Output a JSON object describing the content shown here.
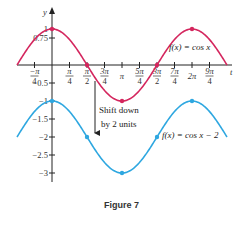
{
  "chart_data": {
    "type": "line",
    "title": "",
    "caption": "Figure 7",
    "xlabel": "t",
    "ylabel": "y",
    "xlim": [
      -1.5708,
      7.854
    ],
    "ylim": [
      -3.2,
      1.2
    ],
    "grid": false,
    "x_ticks": [
      {
        "num": "−π",
        "den": "4",
        "value": -0.7854
      },
      {
        "num": "π",
        "den": "4",
        "value": 0.7854
      },
      {
        "num": "π",
        "den": "2",
        "value": 1.5708
      },
      {
        "num": "3π",
        "den": "4",
        "value": 2.3562
      },
      {
        "num": "π",
        "den": "",
        "value": 3.1416
      },
      {
        "num": "5π",
        "den": "4",
        "value": 3.927
      },
      {
        "num": "3π",
        "den": "2",
        "value": 4.7124
      },
      {
        "num": "7π",
        "den": "4",
        "value": 5.4978
      },
      {
        "num": "2π",
        "den": "",
        "value": 6.2832
      },
      {
        "num": "9π",
        "den": "4",
        "value": 7.0686
      }
    ],
    "y_ticks": [
      {
        "label": "1",
        "value": 1
      },
      {
        "label": "0.75",
        "value": 0.75
      },
      {
        "label": "−0.5",
        "value": -0.5
      },
      {
        "label": "−1",
        "value": -1
      },
      {
        "label": "−1.5",
        "value": -1.5
      },
      {
        "label": "−2",
        "value": -2
      },
      {
        "label": "−2.5",
        "value": -2.5
      },
      {
        "label": "−3",
        "value": -3
      }
    ],
    "series": [
      {
        "name": "f(x) = cos x",
        "color": "#d4265e",
        "function": "cos(x)",
        "domain": [
          -1.5708,
          7.854
        ],
        "marked_points": [
          [
            0,
            1
          ],
          [
            1.5708,
            0
          ],
          [
            3.1416,
            -1
          ],
          [
            4.7124,
            0
          ],
          [
            6.2832,
            1
          ]
        ]
      },
      {
        "name": "f(x) = cos x − 2",
        "color": "#2ea7e0",
        "function": "cos(x) - 2",
        "domain": [
          -1.5708,
          7.854
        ],
        "marked_points": [
          [
            0,
            -1
          ],
          [
            1.5708,
            -2
          ],
          [
            3.1416,
            -3
          ],
          [
            4.7124,
            -2
          ],
          [
            6.2832,
            -1
          ]
        ]
      }
    ],
    "annotations": [
      {
        "text_line1": "Shift down",
        "text_line2": "by 2 units",
        "arrow": "down"
      }
    ]
  },
  "labels": {
    "y_axis": "y",
    "x_axis": "t",
    "red_curve": "f(x) = cos x",
    "blue_curve": "f(x) = cos x − 2",
    "shift_line1": "Shift down",
    "shift_line2": "by 2 units",
    "caption": "Figure 7"
  }
}
